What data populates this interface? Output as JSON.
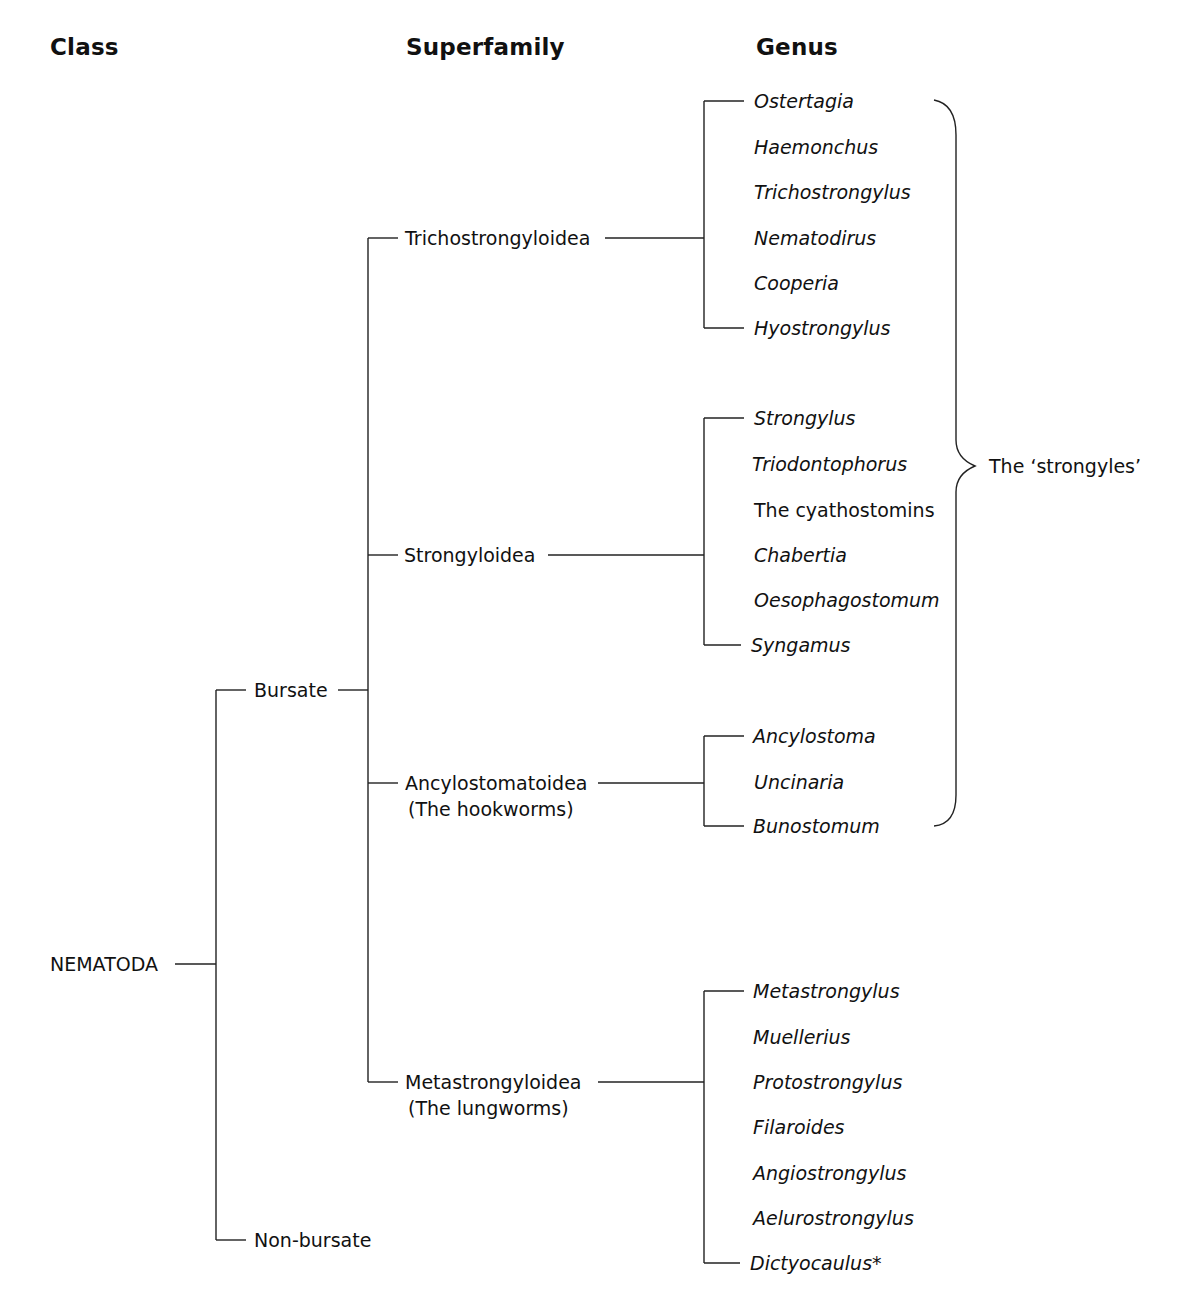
{
  "headers": {
    "class": "Class",
    "superfamily": "Superfamily",
    "genus": "Genus"
  },
  "root": {
    "label": "NEMATODA"
  },
  "classes": [
    {
      "label": "Bursate"
    },
    {
      "label": "Non-bursate"
    }
  ],
  "superfamilies": [
    {
      "label": "Trichostrongyloidea",
      "sublabel": "",
      "genera": [
        "Ostertagia",
        "Haemonchus",
        "Trichostrongylus",
        "Nematodirus",
        "Cooperia",
        "Hyostrongylus"
      ]
    },
    {
      "label": "Strongyloidea",
      "sublabel": "",
      "genera": [
        "Strongylus",
        "Triodontophorus",
        "The cyathostomins",
        "Chabertia",
        "Oesophagostomum",
        "Syngamus"
      ]
    },
    {
      "label": "Ancylostomatoidea",
      "sublabel": "(The hookworms)",
      "genera": [
        "Ancylostoma",
        "Uncinaria",
        "Bunostomum"
      ]
    },
    {
      "label": "Metastrongyloidea",
      "sublabel": "(The lungworms)",
      "genera": [
        "Metastrongylus",
        "Muellerius",
        "Protostrongylus",
        "Filaroides",
        "Angiostrongylus",
        "Aelurostrongylus",
        "Dictyocaulus*"
      ]
    }
  ],
  "brace": {
    "label": "The ‘strongyles’"
  },
  "colors": {
    "line": "#222222",
    "text": "#111111",
    "background": "#ffffff"
  }
}
